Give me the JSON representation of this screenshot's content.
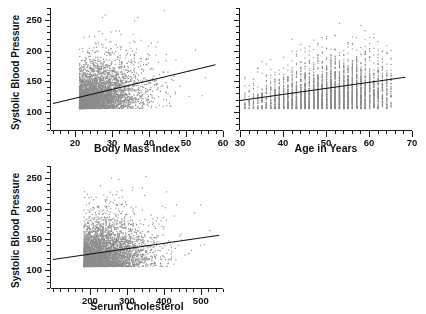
{
  "figure": {
    "background": "#ffffff",
    "point_color": "#8c8c8c",
    "line_color": "#111111",
    "axis_color": "#1a1a1a"
  },
  "panels": [
    {
      "id": "bmi",
      "xlabel": "Body Mass Index",
      "ylabel": "Systolic Blood Pressure",
      "xticks": [
        "20",
        "30",
        "40",
        "50",
        "60"
      ],
      "yticks": [
        "100",
        "150",
        "200",
        "250"
      ]
    },
    {
      "id": "age",
      "xlabel": "Age in Years",
      "ylabel": "",
      "xticks": [
        "30",
        "40",
        "50",
        "60",
        "70"
      ],
      "yticks": []
    },
    {
      "id": "chol",
      "xlabel": "Serum Cholesterol",
      "ylabel": "Systolic Blood Pressure",
      "xticks": [
        "200",
        "300",
        "400",
        "500"
      ],
      "yticks": [
        "100",
        "150",
        "200",
        "250"
      ]
    }
  ],
  "chart_data": [
    {
      "type": "scatter",
      "title": "",
      "xlabel": "Body Mass Index",
      "ylabel": "Systolic Blood Pressure",
      "xlim": [
        13.5,
        60
      ],
      "ylim": [
        70,
        270
      ],
      "xticks": [
        20,
        30,
        40,
        50,
        60
      ],
      "yticks": [
        100,
        150,
        200,
        250
      ],
      "xminor_step": 2,
      "yminor_step": 10,
      "grid": false,
      "legend": "none",
      "n_points": 4200,
      "cloud": {
        "x_mean": 26.5,
        "x_sd": 4.6,
        "x_skew": 0.55,
        "y_mean": 131.0,
        "y_sd": 21.0,
        "y_skew": 0.55,
        "correlation": 0.3
      },
      "fit_line": {
        "x0": 14.0,
        "y0": 114.5,
        "x1": 58.0,
        "y1": 178.0,
        "slope": 1.44,
        "intercept": 94.3
      }
    },
    {
      "type": "scatter",
      "title": "",
      "xlabel": "Age in Years",
      "ylabel": "Systolic Blood Pressure",
      "xlim": [
        30,
        70
      ],
      "ylim": [
        70,
        270
      ],
      "xticks": [
        30,
        40,
        50,
        60,
        70
      ],
      "yticks": [
        100,
        150,
        200,
        250
      ],
      "xminor_step": 2,
      "yminor_step": 10,
      "grid": false,
      "legend": "none",
      "n_points": 4200,
      "x_discrete": true,
      "x_range_data": [
        31,
        65
      ],
      "cloud": {
        "x_mean": 50.0,
        "x_sd": 8.5,
        "x_skew": -0.1,
        "y_mean": 131.0,
        "y_sd": 21.0,
        "y_skew": 0.55,
        "correlation": 0.26
      },
      "fit_line": {
        "x0": 30.0,
        "y0": 118.5,
        "x1": 68.5,
        "y1": 156.5,
        "slope": 0.99,
        "intercept": 88.9
      }
    },
    {
      "type": "scatter",
      "title": "",
      "xlabel": "Serum Cholesterol",
      "ylabel": "Systolic Blood Pressure",
      "xlim": [
        95,
        560
      ],
      "ylim": [
        70,
        270
      ],
      "xticks": [
        200,
        300,
        400,
        500
      ],
      "yticks": [
        100,
        150,
        200,
        250
      ],
      "xminor_step": 20,
      "yminor_step": 10,
      "grid": false,
      "legend": "none",
      "n_points": 4200,
      "cloud": {
        "x_mean": 243.0,
        "x_sd": 48.0,
        "x_skew": 0.5,
        "y_mean": 131.0,
        "y_sd": 21.0,
        "y_skew": 0.55,
        "correlation": 0.16
      },
      "fit_line": {
        "x0": 100.0,
        "y0": 118.0,
        "x1": 550.0,
        "y1": 158.0,
        "slope": 0.0889,
        "intercept": 109.1
      }
    }
  ]
}
